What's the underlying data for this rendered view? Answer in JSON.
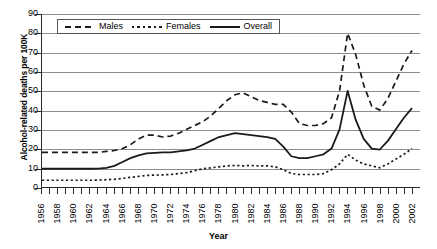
{
  "chart_data": {
    "type": "line",
    "title": "",
    "xlabel": "Year",
    "ylabel": "Alcohol-related deaths per 100K",
    "ylim": [
      0,
      90
    ],
    "ytick_step": 10,
    "yticks": [
      0,
      10,
      20,
      30,
      40,
      50,
      60,
      70,
      80,
      90
    ],
    "xlim": [
      1956,
      2003
    ],
    "grid": "horizontal",
    "legend_position": "top-left-inside",
    "x": [
      1956,
      1957,
      1958,
      1959,
      1960,
      1961,
      1962,
      1963,
      1964,
      1965,
      1966,
      1967,
      1968,
      1969,
      1970,
      1971,
      1972,
      1973,
      1974,
      1975,
      1976,
      1977,
      1978,
      1979,
      1980,
      1981,
      1982,
      1983,
      1984,
      1985,
      1986,
      1987,
      1988,
      1989,
      1990,
      1991,
      1992,
      1993,
      1994,
      1995,
      1996,
      1997,
      1998,
      1999,
      2000,
      2001,
      2002
    ],
    "xtick_labels": [
      "1956",
      "1958",
      "1960",
      "1962",
      "1964",
      "1966",
      "1968",
      "1970",
      "1972",
      "1974",
      "1976",
      "1978",
      "1980",
      "1982",
      "1984",
      "1986",
      "1988",
      "1990",
      "1992",
      "1994",
      "1996",
      "1998",
      "2000",
      "2002"
    ],
    "series": [
      {
        "name": "Males",
        "style": "dashed",
        "color": "#1a1a1a",
        "values": [
          18,
          18,
          18,
          18,
          18,
          18,
          18,
          18,
          18.5,
          19,
          20,
          22,
          25,
          27,
          27,
          26,
          26.5,
          28,
          30,
          32,
          34,
          37,
          41,
          45,
          48,
          49,
          47,
          45,
          44,
          43,
          43,
          39,
          33,
          32,
          32,
          33,
          36,
          50,
          80,
          69,
          53,
          42,
          40,
          46,
          55,
          64,
          71
        ]
      },
      {
        "name": "Females",
        "style": "dotted",
        "color": "#1a1a1a",
        "values": [
          3.5,
          3.5,
          3.5,
          3.5,
          3.5,
          3.5,
          3.5,
          3.6,
          3.8,
          4,
          4.5,
          5,
          5.5,
          6,
          6.2,
          6.3,
          6.5,
          7,
          7.5,
          8.5,
          9.5,
          10,
          10.5,
          11,
          11.2,
          11,
          11.2,
          11,
          11,
          10.5,
          9,
          7,
          6.5,
          6.5,
          6.5,
          7,
          9,
          12,
          17,
          14,
          12,
          11,
          10,
          12,
          14.5,
          17,
          20
        ]
      },
      {
        "name": "Overall",
        "style": "solid",
        "color": "#1a1a1a",
        "values": [
          9.5,
          9.5,
          9.5,
          9.5,
          9.5,
          9.5,
          9.5,
          9.6,
          10,
          11,
          13,
          15,
          16.5,
          17.5,
          17.8,
          18,
          18,
          18.5,
          19,
          20,
          22,
          24,
          26,
          27,
          28,
          27.5,
          27,
          26.5,
          26,
          25,
          21,
          16,
          15,
          15,
          16,
          17,
          20,
          30,
          50,
          35,
          25,
          20,
          19.5,
          24,
          30,
          36,
          41
        ]
      }
    ]
  },
  "legend": {
    "items": [
      {
        "label": "Males",
        "symbol": "dashed-line-icon"
      },
      {
        "label": "Females",
        "symbol": "dotted-line-icon"
      },
      {
        "label": "Overall",
        "symbol": "solid-line-icon"
      }
    ]
  }
}
